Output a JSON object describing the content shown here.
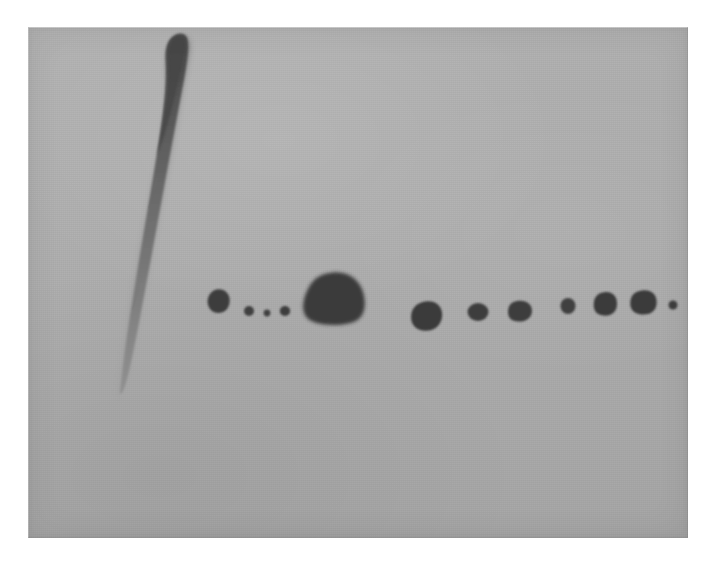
{
  "image": {
    "kind": "painting-photograph",
    "width": 717,
    "height": 579,
    "surround_color": "#ffffff",
    "alt_text": "Abstract painting on a flat gray ground: one long vertical tapering dark brushstroke at the left, and a horizontal row of twelve dark round blobs of varying size."
  },
  "canvas": {
    "left": 28,
    "top": 27,
    "width": 660,
    "height": 511,
    "ground_color": "#ababab",
    "ground_color_light": "#b2b2b2",
    "ground_color_dark": "#a4a4a4",
    "texture": "linen-weave-grain"
  },
  "palette": {
    "ground": "#ababab",
    "mark_dark": "#3b3b3b",
    "mark_mid": "#555555",
    "mark_faded": "#7e7e7e",
    "paper": "#ffffff"
  },
  "marks": {
    "stroke": {
      "name": "vertical-brushstroke",
      "description": "Long vertical stroke, rounded dark head at top, tapering and fading to a thin pale tail at bottom",
      "top": 32,
      "bottom": 393,
      "head_x": 180,
      "tail_x": 118,
      "head_width": 26,
      "tail_width": 11,
      "color_top": "#4a4a4a",
      "color_bottom": "#8b8b8b"
    },
    "dots_label": "row-of-blobs",
    "dots_count": 12,
    "dots": [
      {
        "id": 1,
        "cx": 216,
        "cy": 300,
        "rx": 11.0,
        "ry": 11.5,
        "color": "#3d3d3d"
      },
      {
        "id": 2,
        "cx": 249,
        "cy": 311,
        "rx": 5.0,
        "ry": 5.0,
        "color": "#3f3f3f"
      },
      {
        "id": 3,
        "cx": 267,
        "cy": 313,
        "rx": 3.4,
        "ry": 3.4,
        "color": "#414141"
      },
      {
        "id": 4,
        "cx": 285,
        "cy": 311,
        "rx": 5.2,
        "ry": 5.0,
        "color": "#3e3e3e"
      },
      {
        "id": 5,
        "cx": 334,
        "cy": 297,
        "rx": 30.0,
        "ry": 25.0,
        "color": "#3a3a3a"
      },
      {
        "id": 6,
        "cx": 427,
        "cy": 314,
        "rx": 14.5,
        "ry": 12.5,
        "color": "#3b3b3b"
      },
      {
        "id": 7,
        "cx": 478,
        "cy": 312,
        "rx": 10.5,
        "ry": 9.0,
        "color": "#3d3d3d"
      },
      {
        "id": 8,
        "cx": 521,
        "cy": 309,
        "rx": 10.5,
        "ry": 8.5,
        "color": "#3c3c3c"
      },
      {
        "id": 9,
        "cx": 568,
        "cy": 306,
        "rx": 7.5,
        "ry": 8.0,
        "color": "#3f3f3f"
      },
      {
        "id": 10,
        "cx": 605,
        "cy": 303,
        "rx": 11.0,
        "ry": 11.0,
        "color": "#3a3a3a"
      },
      {
        "id": 11,
        "cx": 643,
        "cy": 302,
        "rx": 13.0,
        "ry": 11.5,
        "color": "#3a3a3a"
      },
      {
        "id": 12,
        "cx": 673,
        "cy": 305,
        "rx": 4.5,
        "ry": 4.5,
        "color": "#3e3e3e"
      }
    ]
  },
  "chart_data": {
    "type": "scatter",
    "title": "",
    "xlabel": "",
    "ylabel": "",
    "x": [
      216,
      249,
      267,
      285,
      334,
      427,
      478,
      521,
      568,
      605,
      643,
      673
    ],
    "y": [
      300,
      311,
      313,
      311,
      297,
      314,
      312,
      309,
      306,
      303,
      302,
      305
    ],
    "values": [
      11.0,
      5.0,
      3.4,
      5.2,
      30.0,
      14.5,
      10.5,
      10.5,
      7.5,
      11.0,
      13.0,
      4.5
    ],
    "xlim": [
      28,
      688
    ],
    "ylim": [
      27,
      538
    ],
    "grid": false,
    "legend": false
  }
}
